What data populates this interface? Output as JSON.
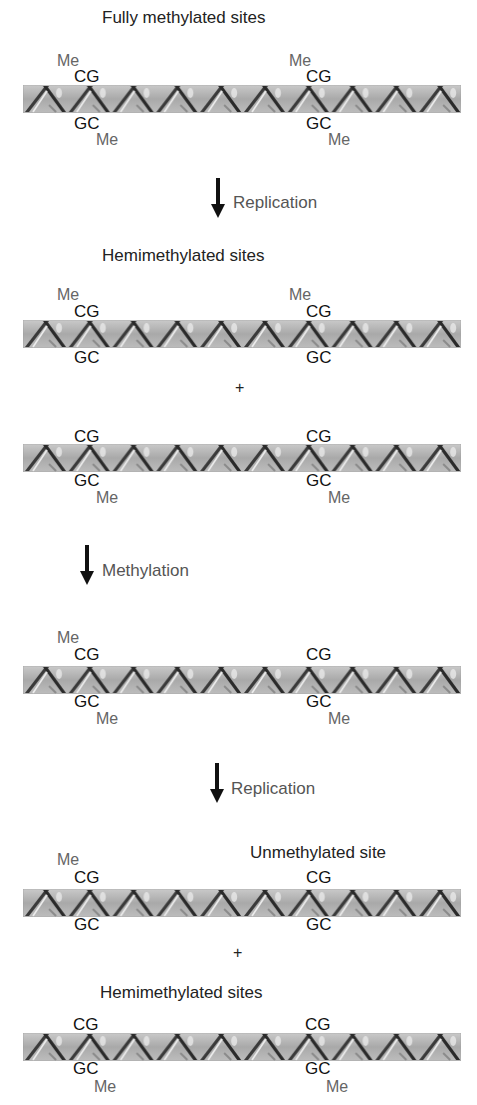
{
  "diagram": {
    "stages": [
      {
        "label": "Fully methylated sites",
        "top_site_left": {
          "me": "Me",
          "bases": "CG"
        },
        "bottom_site_left": {
          "bases": "GC",
          "me": "Me"
        },
        "top_site_right": {
          "me": "Me",
          "bases": "CG"
        },
        "bottom_site_right": {
          "bases": "GC",
          "me": "Me"
        }
      },
      {
        "label": "Hemimethylated sites",
        "top_site_left": {
          "me": "Me",
          "bases": "CG"
        },
        "bottom_site_left": {
          "bases": "GC"
        },
        "top_site_right": {
          "me": "Me",
          "bases": "CG"
        },
        "bottom_site_right": {
          "bases": "GC"
        }
      },
      {
        "label": "",
        "top_site_left": {
          "bases": "CG"
        },
        "bottom_site_left": {
          "bases": "GC",
          "me": "Me"
        },
        "top_site_right": {
          "bases": "CG"
        },
        "bottom_site_right": {
          "bases": "GC",
          "me": "Me"
        }
      },
      {
        "label": "",
        "top_site_left": {
          "me": "Me",
          "bases": "CG"
        },
        "bottom_site_left": {
          "bases": "GC",
          "me": "Me"
        },
        "top_site_right": {
          "bases": "CG"
        },
        "bottom_site_right": {
          "bases": "GC",
          "me": "Me"
        }
      },
      {
        "label": "Unmethylated site",
        "top_site_left": {
          "me": "Me",
          "bases": "CG"
        },
        "bottom_site_left": {
          "bases": "GC"
        },
        "top_site_right": {
          "bases": "CG"
        },
        "bottom_site_right": {
          "bases": "GC"
        }
      },
      {
        "label": "Hemimethylated sites",
        "top_site_left": {
          "bases": "CG"
        },
        "bottom_site_left": {
          "bases": "GC",
          "me": "Me"
        },
        "top_site_right": {
          "bases": "CG"
        },
        "bottom_site_right": {
          "bases": "GC",
          "me": "Me"
        }
      }
    ],
    "steps": [
      {
        "label": "Replication"
      },
      {
        "label": "Methylation"
      },
      {
        "label": "Replication"
      }
    ],
    "plus_sign": "+",
    "colors": {
      "helix_band": "#b4b4b4",
      "strand_dark": "#2e2e2e",
      "strand_light": "#e6e6e6",
      "methyl_label": "#666666",
      "base_label": "#111111",
      "arrow": "#111111"
    }
  }
}
